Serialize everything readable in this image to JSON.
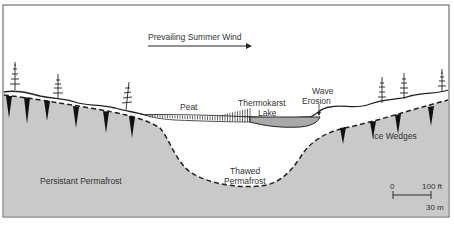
{
  "diagram": {
    "labels": {
      "wind": "Prevailing Summer Wind",
      "peat": "Peat",
      "lake_line1": "Thermokarst",
      "lake_line2": "Lake",
      "wave_line1": "Wave",
      "wave_line2": "Erosion",
      "ice_wedges": "Ice Wedges",
      "persistent": "Persistant Permafrost",
      "thawed_line1": "Thawed",
      "thawed_line2": "Permafrost"
    },
    "scale_bar": {
      "start_label": "0",
      "end_label_ft": "100 ft",
      "end_label_m": "30 m"
    },
    "colors": {
      "permafrost": "#c9c9c9",
      "lake": "#a9a9a9",
      "outline": "#222222",
      "background": "#ffffff",
      "text": "#333333"
    }
  }
}
